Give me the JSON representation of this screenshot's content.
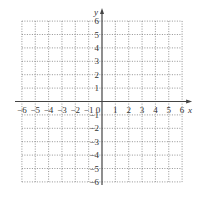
{
  "chart_data": {
    "type": "coordinate-grid",
    "title": "",
    "xlabel": "x",
    "ylabel": "y",
    "xlim": [
      -6,
      6
    ],
    "ylim": [
      -6,
      6
    ],
    "grid": true,
    "grid_style": "dotted",
    "x_ticks": [
      -6,
      -5,
      -4,
      -3,
      -2,
      -1,
      0,
      1,
      2,
      3,
      4,
      5,
      6
    ],
    "y_ticks": [
      6,
      5,
      4,
      3,
      2,
      1,
      -1,
      -2,
      -3,
      -4,
      -5,
      -6
    ],
    "x_tick_labels": [
      "-6",
      "-5",
      "-4",
      "-3",
      "-2",
      "-1",
      "0",
      "1",
      "2",
      "3",
      "4",
      "5",
      "6"
    ],
    "y_tick_labels": [
      "6",
      "5",
      "4",
      "3",
      "2",
      "1",
      "-1",
      "-2",
      "-3",
      "-4",
      "-5",
      "-6"
    ],
    "origin_label": "0",
    "series": []
  },
  "colors": {
    "axis": "#444444",
    "grid": "#777777",
    "background": "#ffffff"
  }
}
